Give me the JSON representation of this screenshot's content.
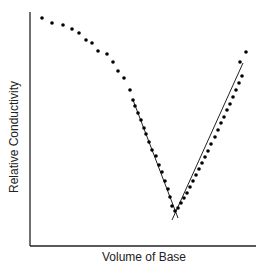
{
  "chart_data": {
    "type": "scatter",
    "title": "",
    "xlabel": "Volume of Base",
    "ylabel": "Relative Conductivity",
    "grid": false,
    "legend": null,
    "axis_ticks": false,
    "points_px": [
      [
        42,
        18
      ],
      [
        52,
        23
      ],
      [
        63,
        25
      ],
      [
        72,
        29
      ],
      [
        79,
        33
      ],
      [
        86,
        40
      ],
      [
        92,
        43
      ],
      [
        98,
        51
      ],
      [
        107,
        54
      ],
      [
        113,
        62
      ],
      [
        118,
        71
      ],
      [
        124,
        78
      ],
      [
        130,
        90
      ],
      [
        133,
        100
      ],
      [
        135,
        106
      ],
      [
        138,
        113
      ],
      [
        141,
        120
      ],
      [
        144,
        128
      ],
      [
        146,
        134
      ],
      [
        149,
        142
      ],
      [
        152,
        150
      ],
      [
        156,
        156
      ],
      [
        159,
        165
      ],
      [
        162,
        172
      ],
      [
        165,
        181
      ],
      [
        168,
        189
      ],
      [
        170,
        197
      ],
      [
        172,
        206
      ],
      [
        175,
        211
      ],
      [
        178,
        208
      ],
      [
        181,
        203
      ],
      [
        184,
        198
      ],
      [
        187,
        193
      ],
      [
        190,
        187
      ],
      [
        193,
        181
      ],
      [
        196,
        175
      ],
      [
        199,
        169
      ],
      [
        202,
        163
      ],
      [
        205,
        157
      ],
      [
        208,
        151
      ],
      [
        211,
        144
      ],
      [
        215,
        137
      ],
      [
        218,
        130
      ],
      [
        221,
        123
      ],
      [
        224,
        117
      ],
      [
        227,
        110
      ],
      [
        230,
        104
      ],
      [
        233,
        97
      ],
      [
        236,
        90
      ],
      [
        239,
        83
      ],
      [
        242,
        76
      ],
      [
        240,
        62
      ],
      [
        246,
        52
      ]
    ],
    "fit_lines_px": [
      {
        "name": "descending",
        "x1": 133,
        "y1": 100,
        "x2": 178,
        "y2": 218
      },
      {
        "name": "ascending",
        "x1": 172,
        "y1": 220,
        "x2": 243,
        "y2": 63
      }
    ]
  }
}
